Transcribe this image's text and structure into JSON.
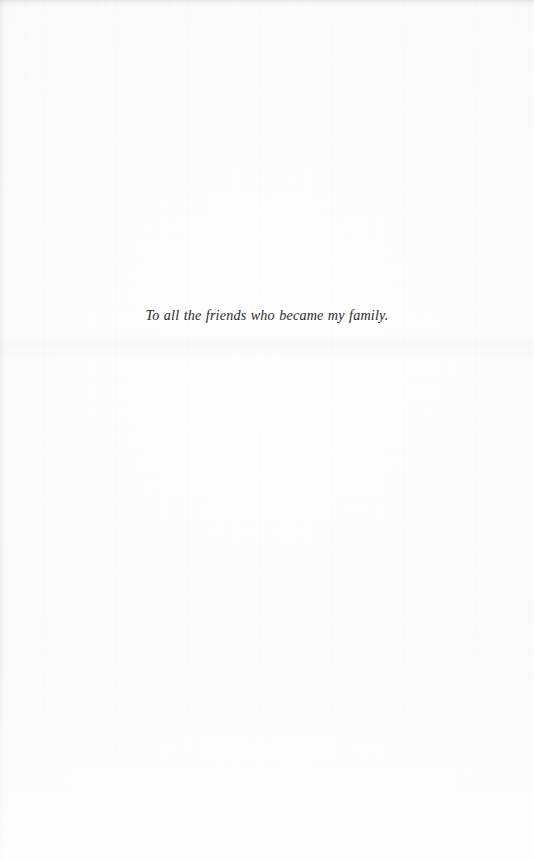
{
  "page": {
    "kind": "book-dedication-page",
    "background_color": "#fdfdfc",
    "text_color": "#2b2a29",
    "width": 534,
    "height": 861
  },
  "dedication": {
    "text": "To all the friends who became my family."
  }
}
